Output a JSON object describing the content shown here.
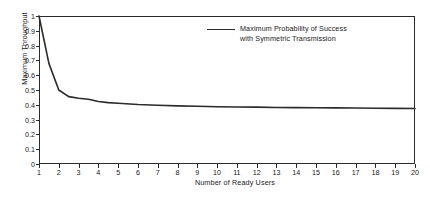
{
  "chart_data": {
    "type": "line",
    "title": "",
    "xlabel": "Number of Ready Users",
    "ylabel": "Maximum Throughput",
    "xlim": [
      1,
      20
    ],
    "ylim": [
      0,
      1
    ],
    "grid": false,
    "legend_position": "top-right-inside",
    "x_ticks": [
      "1",
      "2",
      "3",
      "4",
      "5",
      "6",
      "7",
      "8",
      "9",
      "10",
      "11",
      "12",
      "13",
      "14",
      "15",
      "16",
      "17",
      "18",
      "19",
      "20"
    ],
    "y_ticks": [
      "0",
      "0.1",
      "0.2",
      "0.3",
      "0.4",
      "0.5",
      "0.6",
      "0.7",
      "0.8",
      "0.9",
      "1"
    ],
    "series": [
      {
        "name": "Maximum Probability of Success with Symmetric Transmission",
        "legend_line1": "Maximum Probability of Success",
        "legend_line2": "with Symmetric Transmission",
        "color": "#2b2b2b",
        "x": [
          1,
          1.5,
          2,
          2.5,
          3,
          3.5,
          4,
          4.5,
          5,
          6,
          7,
          8,
          9,
          10,
          11,
          12,
          13,
          14,
          15,
          16,
          17,
          18,
          19,
          20
        ],
        "values": [
          1.0,
          0.68,
          0.5,
          0.455,
          0.444,
          0.437,
          0.422,
          0.415,
          0.41,
          0.402,
          0.397,
          0.393,
          0.39,
          0.387,
          0.385,
          0.384,
          0.382,
          0.381,
          0.38,
          0.379,
          0.378,
          0.377,
          0.376,
          0.375
        ]
      }
    ]
  }
}
